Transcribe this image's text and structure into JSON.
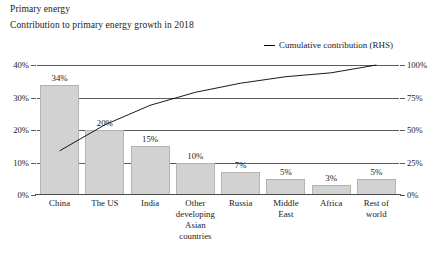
{
  "header": {
    "title": "Primary energy",
    "subtitle": "Contribution to primary energy growth in 2018"
  },
  "legend": {
    "series_label": "Cumulative contribution (RHS)",
    "marker": "line-dash-icon",
    "color": "#000000"
  },
  "chart_data": {
    "type": "bar",
    "title": "Primary energy",
    "subtitle": "Contribution to primary energy growth in 2018",
    "xlabel": "",
    "ylabel": "",
    "categories": [
      "China",
      "The US",
      "India",
      "Other\ndeveloping\nAsian countries",
      "Russia",
      "Middle\nEast",
      "Africa",
      "Rest of\nworld"
    ],
    "values": [
      34,
      20,
      15,
      10,
      7,
      5,
      3,
      5
    ],
    "value_labels": [
      "34%",
      "20%",
      "15%",
      "10%",
      "7%",
      "5%",
      "3%",
      "5%"
    ],
    "ylim": [
      0,
      40
    ],
    "yticks": [
      0,
      10,
      20,
      30,
      40
    ],
    "ytick_labels": [
      "0%",
      "10%",
      "20%",
      "30%",
      "40%"
    ],
    "series": [
      {
        "name": "Cumulative contribution (RHS)",
        "type": "line",
        "axis": "right",
        "values": [
          34,
          54,
          69,
          79,
          86,
          91,
          94,
          100
        ],
        "color": "#000000"
      }
    ],
    "y2lim": [
      0,
      100
    ],
    "y2ticks": [
      0,
      25,
      50,
      75,
      100
    ],
    "y2tick_labels": [
      "0%",
      "25%",
      "50%",
      "75%",
      "100%"
    ],
    "grid": true,
    "legend_position": "top-right",
    "bar_color": "#d2d2d2"
  }
}
